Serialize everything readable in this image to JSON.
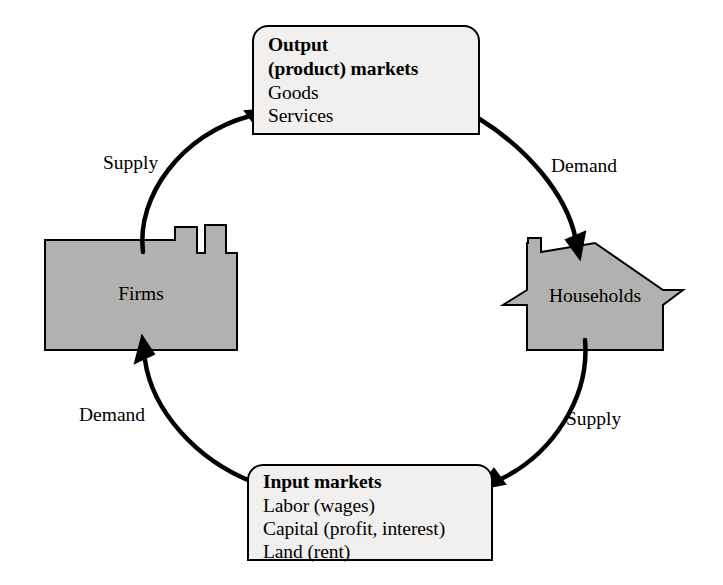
{
  "diagram": {
    "colors": {
      "actor_fill": "#b2b1af",
      "box_fill": "#f1f0ee",
      "stroke": "#000000",
      "background": "#ffffff"
    }
  },
  "output_markets": {
    "title_line1": "Output",
    "title_line2": "(product) markets",
    "items": [
      "Goods",
      "Services"
    ]
  },
  "input_markets": {
    "title": "Input markets",
    "items": [
      "Labor (wages)",
      "Capital (profit, interest)",
      "Land (rent)"
    ]
  },
  "actors": {
    "firms": {
      "label": "Firms",
      "icon": "factory-icon"
    },
    "households": {
      "label": "Households",
      "icon": "house-icon"
    }
  },
  "flows": [
    {
      "id": "firms-to-output",
      "label": "Supply",
      "from": "firms",
      "to": "output_markets",
      "arrow": "arrow-up-right-icon"
    },
    {
      "id": "output-to-households",
      "label": "Demand",
      "from": "output_markets",
      "to": "households",
      "arrow": "arrow-down-right-icon"
    },
    {
      "id": "households-to-input",
      "label": "Supply",
      "from": "households",
      "to": "input_markets",
      "arrow": "arrow-down-left-icon"
    },
    {
      "id": "input-to-firms",
      "label": "Demand",
      "from": "input_markets",
      "to": "firms",
      "arrow": "arrow-up-left-icon"
    }
  ]
}
